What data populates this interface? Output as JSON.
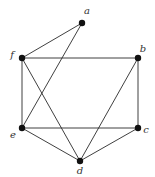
{
  "diagram": {
    "type": "graph",
    "nodes": [
      {
        "id": "a",
        "label": "a"
      },
      {
        "id": "b",
        "label": "b"
      },
      {
        "id": "c",
        "label": "c"
      },
      {
        "id": "d",
        "label": "d"
      },
      {
        "id": "e",
        "label": "e"
      },
      {
        "id": "f",
        "label": "f"
      }
    ],
    "edges": [
      {
        "from": "a",
        "to": "f"
      },
      {
        "from": "a",
        "to": "e"
      },
      {
        "from": "f",
        "to": "b"
      },
      {
        "from": "f",
        "to": "e"
      },
      {
        "from": "f",
        "to": "d"
      },
      {
        "from": "b",
        "to": "c"
      },
      {
        "from": "b",
        "to": "d"
      },
      {
        "from": "e",
        "to": "c"
      },
      {
        "from": "e",
        "to": "d"
      },
      {
        "from": "c",
        "to": "d"
      }
    ]
  }
}
